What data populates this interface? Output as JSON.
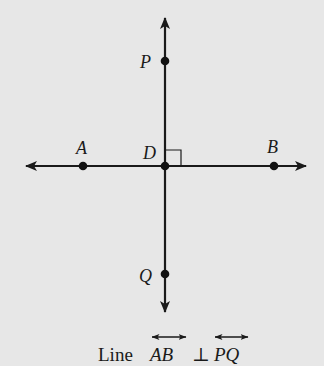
{
  "diagram": {
    "background_color": "#e7e7e7",
    "line_color": "#1a1a1a",
    "lines": [
      {
        "name": "AB",
        "orientation": "horizontal",
        "type": "line"
      },
      {
        "name": "PQ",
        "orientation": "vertical",
        "type": "line"
      }
    ],
    "points": {
      "A": {
        "label": "A",
        "x": 83,
        "y": 166
      },
      "B": {
        "label": "B",
        "x": 274,
        "y": 166
      },
      "D": {
        "label": "D",
        "x": 165,
        "y": 166
      },
      "P": {
        "label": "P",
        "x": 165,
        "y": 61
      },
      "Q": {
        "label": "Q",
        "x": 165,
        "y": 274
      }
    },
    "right_angle_marker": {
      "at": "D",
      "size": 16
    },
    "caption": {
      "prefix": "Line ",
      "line1": "AB",
      "symbol": "⊥",
      "line2": "PQ"
    }
  }
}
